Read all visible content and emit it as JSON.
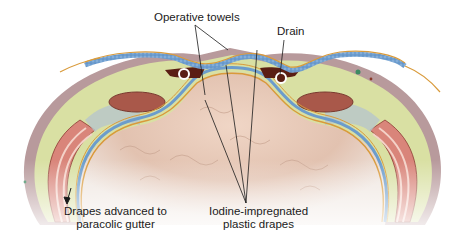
{
  "figure": {
    "labels": {
      "operative_towels": "Operative towels",
      "drain": "Drain",
      "drapes_advanced_line1": "Drapes advanced to",
      "drapes_advanced_line2": "paracolic gutter",
      "iodine_line1": "Iodine-impregnated",
      "iodine_line2": "plastic drapes"
    },
    "colors": {
      "skin": "#b89a9c",
      "fat": "#d9e0a3",
      "towel_blue": "#6c9ccc",
      "drape_orange": "#d99a3a",
      "muscle_red": "#d9857a",
      "rectus": "#a9584a",
      "bowel": "#e6c9b8",
      "drain_dark": "#5a1e14"
    }
  }
}
